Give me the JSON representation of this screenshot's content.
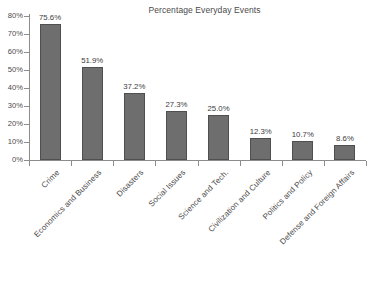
{
  "chart_data": {
    "type": "bar",
    "title": "Percentage Everyday Events",
    "xlabel": "",
    "ylabel": "",
    "categories": [
      "Crime",
      "Economics and Business",
      "Disasters",
      "Social Issues",
      "Science and Tech.",
      "Civilization and Culture",
      "Politics and Policy",
      "Defense and Foreign Affairs"
    ],
    "values": [
      75.6,
      51.9,
      37.2,
      27.3,
      25.0,
      12.3,
      10.7,
      8.6
    ],
    "value_labels": [
      "75.6%",
      "51.9%",
      "37.2%",
      "27.3%",
      "25.0%",
      "12.3%",
      "10.7%",
      "8.6%"
    ],
    "ylim": [
      0,
      80
    ],
    "ytick_values": [
      0,
      10,
      20,
      30,
      40,
      50,
      60,
      70,
      80
    ],
    "ytick_labels": [
      "0%",
      "10%",
      "20%",
      "30%",
      "40%",
      "50%",
      "60%",
      "70%",
      "80%"
    ],
    "grid": false,
    "legend": false,
    "bar_color": "#6e6e6e",
    "bar_edge_color": "#4f4f4f",
    "axis_color": "#8d8d8d",
    "text_color": "#4a4a4a",
    "background": "#ffffff"
  }
}
